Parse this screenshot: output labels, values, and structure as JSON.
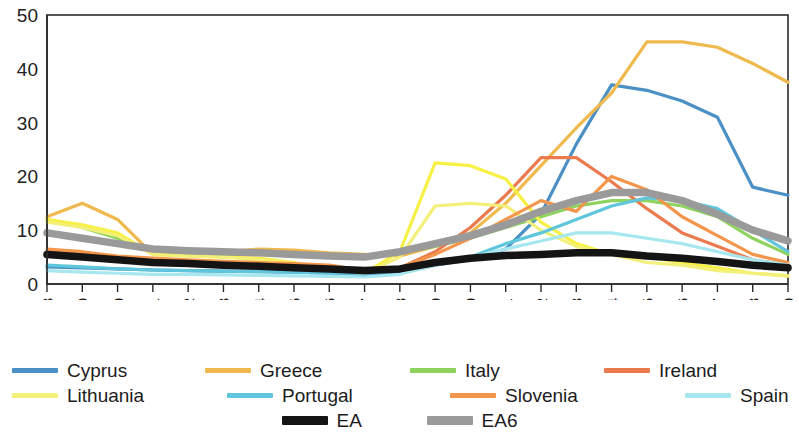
{
  "chart_data": {
    "type": "line",
    "title": "",
    "subtitle": "",
    "xlabel": "",
    "ylabel": "",
    "grid": false,
    "legend_position": "bottom",
    "ylim": [
      0,
      50
    ],
    "yticks": [
      0,
      10,
      20,
      30,
      40,
      50
    ],
    "ytick_labels": [
      "0",
      "10",
      "20",
      "30",
      "40",
      "50"
    ],
    "categories": [
      "1998",
      "1999",
      "2000",
      "2001",
      "2002",
      "2003",
      "2004",
      "2005",
      "2006",
      "2007",
      "2008",
      "2009",
      "2010",
      "2011",
      "2012",
      "2013",
      "2014",
      "2015",
      "2016",
      "2017",
      "2018",
      "2019"
    ],
    "series": [
      {
        "name": "Cyprus",
        "color": "#4a90c4",
        "width": 3.2,
        "values": [
          3.2,
          3.0,
          2.8,
          2.6,
          2.5,
          2.4,
          2.3,
          2.2,
          2.0,
          1.8,
          2.0,
          3.5,
          4.5,
          6.5,
          13.0,
          26.0,
          37.0,
          36.0,
          34.0,
          31.0,
          18.0,
          16.5
        ]
      },
      {
        "name": "Greece",
        "color": "#f0b94d",
        "width": 3.2,
        "values": [
          12.5,
          15.0,
          12.0,
          5.5,
          5.5,
          6.0,
          6.5,
          6.3,
          5.8,
          5.5,
          5.2,
          7.0,
          9.5,
          15.0,
          22.0,
          29.0,
          35.5,
          45.0,
          45.0,
          44.0,
          41.0,
          37.5
        ]
      },
      {
        "name": "Italy",
        "color": "#8ed35e",
        "width": 3.2,
        "values": [
          12.0,
          10.5,
          8.5,
          6.0,
          5.8,
          5.5,
          5.5,
          5.5,
          5.5,
          5.3,
          5.8,
          7.0,
          8.5,
          10.5,
          12.5,
          14.5,
          15.5,
          15.5,
          14.5,
          12.5,
          8.5,
          5.5
        ]
      },
      {
        "name": "Ireland",
        "color": "#ec7a4f",
        "width": 3.2,
        "values": [
          6.0,
          5.5,
          5.0,
          4.5,
          4.2,
          4.0,
          3.8,
          3.5,
          3.2,
          2.5,
          3.0,
          6.0,
          10.5,
          16.5,
          23.5,
          23.5,
          19.0,
          14.0,
          9.5,
          7.0,
          4.5,
          3.5
        ]
      },
      {
        "name": "Latvia",
        "color": "#f7f045",
        "width": 3.2,
        "values": [
          12.0,
          11.0,
          9.5,
          5.5,
          5.2,
          5.0,
          4.8,
          4.0,
          2.5,
          2.0,
          6.0,
          22.5,
          22.0,
          19.5,
          11.5,
          7.5,
          5.5,
          5.0,
          4.0,
          3.0,
          2.0,
          1.5
        ]
      },
      {
        "name": "Lithuania",
        "color": "#f3f07a",
        "width": 3.2,
        "values": [
          11.5,
          10.5,
          9.0,
          5.5,
          5.2,
          5.0,
          4.5,
          3.8,
          2.5,
          2.0,
          5.0,
          14.5,
          15.0,
          14.5,
          10.0,
          7.0,
          5.5,
          4.0,
          3.5,
          2.5,
          2.0,
          1.5
        ]
      },
      {
        "name": "Portugal",
        "color": "#5fc6db",
        "width": 3.2,
        "values": [
          3.5,
          3.2,
          2.8,
          2.6,
          2.5,
          2.4,
          2.3,
          2.2,
          2.0,
          2.0,
          2.5,
          4.0,
          5.0,
          7.5,
          9.5,
          12.0,
          14.5,
          16.0,
          15.5,
          14.0,
          10.0,
          6.0
        ]
      },
      {
        "name": "Slovenia",
        "color": "#f3954a",
        "width": 3.2,
        "values": [
          6.5,
          6.0,
          5.2,
          4.8,
          4.5,
          4.2,
          4.0,
          3.8,
          3.5,
          2.5,
          3.0,
          5.5,
          8.5,
          12.0,
          15.5,
          13.5,
          20.0,
          17.5,
          12.5,
          9.0,
          5.5,
          4.0
        ]
      },
      {
        "name": "Spain",
        "color": "#a6e7f0",
        "width": 3.2,
        "values": [
          2.5,
          2.2,
          2.0,
          1.8,
          1.8,
          1.7,
          1.6,
          1.5,
          1.4,
          1.3,
          1.8,
          3.5,
          5.0,
          6.5,
          8.0,
          9.5,
          9.5,
          8.5,
          7.5,
          6.0,
          4.5,
          3.5
        ]
      },
      {
        "name": "EA",
        "color": "#141414",
        "width": 7.5,
        "values": [
          5.5,
          5.0,
          4.5,
          4.0,
          3.8,
          3.5,
          3.3,
          3.0,
          2.8,
          2.5,
          2.8,
          4.0,
          4.8,
          5.3,
          5.5,
          5.8,
          5.8,
          5.2,
          4.8,
          4.2,
          3.5,
          3.0
        ]
      },
      {
        "name": "EA6",
        "color": "#9a9a9a",
        "width": 7.5,
        "values": [
          9.5,
          8.5,
          7.5,
          6.5,
          6.2,
          6.0,
          5.8,
          5.5,
          5.2,
          5.0,
          6.0,
          7.5,
          9.0,
          11.0,
          13.5,
          15.5,
          17.0,
          17.0,
          15.5,
          13.0,
          10.0,
          8.0
        ]
      }
    ]
  },
  "legend": {
    "row1": [
      {
        "label": "Cyprus",
        "color": "#4a90c4",
        "thick": false
      },
      {
        "label": "Greece",
        "color": "#f0b94d",
        "thick": false
      },
      {
        "label": "Italy",
        "color": "#8ed35e",
        "thick": false
      },
      {
        "label": "Ireland",
        "color": "#ec7a4f",
        "thick": false
      },
      {
        "label": "Latvia",
        "color": "#f7f045",
        "thick": false
      }
    ],
    "row2": [
      {
        "label": "Lithuania",
        "color": "#f3f07a",
        "thick": false
      },
      {
        "label": "Portugal",
        "color": "#5fc6db",
        "thick": false
      },
      {
        "label": "Slovenia",
        "color": "#f3954a",
        "thick": false
      },
      {
        "label": "Spain",
        "color": "#a6e7f0",
        "thick": false
      }
    ],
    "row3": [
      {
        "label": "EA",
        "color": "#141414",
        "thick": true
      },
      {
        "label": "EA6",
        "color": "#9a9a9a",
        "thick": true
      }
    ]
  },
  "axis": {
    "frame_color": "#2b2b2b",
    "tick_color": "#2b2b2b"
  }
}
